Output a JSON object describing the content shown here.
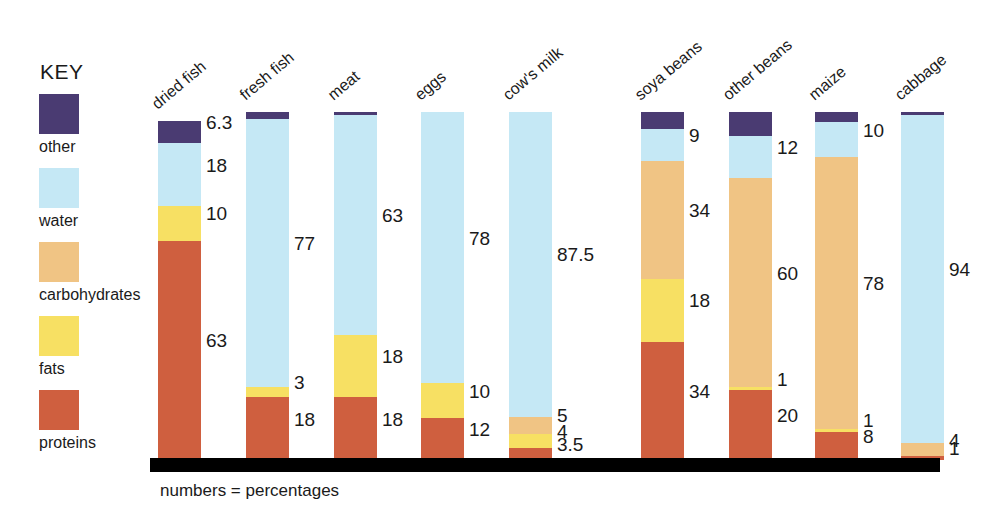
{
  "legend": {
    "title": "KEY",
    "items": [
      {
        "name": "other",
        "color": "#4a3b72"
      },
      {
        "name": "water",
        "color": "#c5e8f5"
      },
      {
        "name": "carbohydrates",
        "color": "#f0c484"
      },
      {
        "name": "fats",
        "color": "#f7e063"
      },
      {
        "name": "proteins",
        "color": "#cf5f3f"
      }
    ]
  },
  "footnote": "numbers = percentages",
  "chart_data": {
    "type": "bar",
    "title": "",
    "xlabel": "",
    "ylabel": "",
    "ylim": [
      0,
      100
    ],
    "grid": false,
    "stacked": true,
    "legend_position": "left",
    "categories": [
      "dried fish",
      "fresh fish",
      "meat",
      "eggs",
      "cow's milk",
      "soya beans",
      "other beans",
      "maize",
      "cabbage"
    ],
    "series": [
      {
        "name": "proteins",
        "color": "#cf5f3f",
        "values": [
          63,
          18,
          18,
          12,
          3.5,
          34,
          20,
          8,
          1
        ]
      },
      {
        "name": "fats",
        "color": "#f7e063",
        "values": [
          10,
          3,
          18,
          10,
          4,
          18,
          1,
          1,
          0
        ]
      },
      {
        "name": "carbohydrates",
        "color": "#f0c484",
        "values": [
          0,
          0,
          0,
          0,
          5,
          34,
          60,
          78,
          4
        ]
      },
      {
        "name": "water",
        "color": "#c5e8f5",
        "values": [
          18,
          77,
          63,
          78,
          87.5,
          9,
          12,
          10,
          94
        ]
      },
      {
        "name": "other",
        "color": "#4a3b72",
        "values": [
          6.3,
          2,
          1,
          0,
          0,
          5,
          7,
          3,
          1
        ]
      }
    ],
    "labels": [
      {
        "category": "dried fish",
        "items": [
          {
            "series": "other",
            "text": "6.3"
          },
          {
            "series": "water",
            "text": "18"
          },
          {
            "series": "fats",
            "text": "10"
          },
          {
            "series": "proteins",
            "text": "63"
          }
        ]
      },
      {
        "category": "fresh fish",
        "items": [
          {
            "series": "water",
            "text": "77"
          },
          {
            "series": "fats",
            "text": "3"
          },
          {
            "series": "proteins",
            "text": "18"
          }
        ]
      },
      {
        "category": "meat",
        "items": [
          {
            "series": "water",
            "text": "63"
          },
          {
            "series": "fats",
            "text": "18"
          },
          {
            "series": "proteins",
            "text": "18"
          }
        ]
      },
      {
        "category": "eggs",
        "items": [
          {
            "series": "water",
            "text": "78"
          },
          {
            "series": "fats",
            "text": "10"
          },
          {
            "series": "proteins",
            "text": "12"
          }
        ]
      },
      {
        "category": "cow's milk",
        "items": [
          {
            "series": "water",
            "text": "87.5"
          },
          {
            "series": "carbohydrates",
            "text": "5"
          },
          {
            "series": "fats",
            "text": "4"
          },
          {
            "series": "proteins",
            "text": "3.5"
          }
        ]
      },
      {
        "category": "soya beans",
        "items": [
          {
            "series": "water",
            "text": "9"
          },
          {
            "series": "carbohydrates",
            "text": "34"
          },
          {
            "series": "fats",
            "text": "18"
          },
          {
            "series": "proteins",
            "text": "34"
          }
        ]
      },
      {
        "category": "other beans",
        "items": [
          {
            "series": "water",
            "text": "12"
          },
          {
            "series": "carbohydrates",
            "text": "60"
          },
          {
            "series": "fats",
            "text": "1"
          },
          {
            "series": "proteins",
            "text": "20"
          }
        ]
      },
      {
        "category": "maize",
        "items": [
          {
            "series": "water",
            "text": "10"
          },
          {
            "series": "carbohydrates",
            "text": "78"
          },
          {
            "series": "fats",
            "text": "1"
          },
          {
            "series": "proteins",
            "text": "8"
          }
        ]
      },
      {
        "category": "cabbage",
        "items": [
          {
            "series": "water",
            "text": "94"
          },
          {
            "series": "carbohydrates",
            "text": "4"
          },
          {
            "series": "proteins",
            "text": "1"
          }
        ]
      }
    ]
  }
}
